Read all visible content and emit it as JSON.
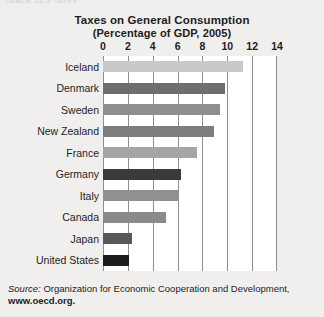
{
  "top_partial_caption": "TABLE 12.3   Taxes",
  "chart_data": {
    "type": "bar",
    "orientation": "horizontal",
    "title": "Taxes on General Consumption",
    "subtitle": "(Percentage of GDP, 2005)",
    "title_lines": [
      "Taxes on General Consumption",
      "(Percentage of GDP, 2005)"
    ],
    "xlabel": "",
    "ylabel": "",
    "xlim": [
      0,
      14
    ],
    "xticks": [
      0,
      2,
      4,
      6,
      8,
      10,
      12,
      14
    ],
    "xtick_labels": [
      "0",
      "2",
      "4",
      "6",
      "8",
      "10",
      "12",
      "14"
    ],
    "grid": true,
    "grid_axis": "x",
    "legend": "none",
    "categories": [
      "Iceland",
      "Denmark",
      "Sweden",
      "New Zealand",
      "France",
      "Germany",
      "Italy",
      "Canada",
      "Japan",
      "United States"
    ],
    "values": [
      11.3,
      9.8,
      9.4,
      8.9,
      7.6,
      6.3,
      6.0,
      5.1,
      2.3,
      2.1
    ],
    "bar_colors": [
      "#c9c9c9",
      "#6e6e6e",
      "#8f8f8f",
      "#7d7d7d",
      "#a6a6a6",
      "#3a3a3a",
      "#909090",
      "#8a8a8a",
      "#595959",
      "#1c1c1c"
    ],
    "series": [
      {
        "name": "Taxes on general consumption (% of GDP)",
        "values": [
          11.3,
          9.8,
          9.4,
          8.9,
          7.6,
          6.3,
          6.0,
          5.1,
          2.3,
          2.1
        ]
      }
    ]
  },
  "source": {
    "label": "Source:",
    "line1_rest": " Organization for Economic Cooperation and Development,",
    "line2": "www.oecd.org."
  },
  "colors": {
    "page_background": "#efefef",
    "plot_background": "#ffffff",
    "gridline": "#8e8e8e",
    "text": "#1d1d1d"
  }
}
